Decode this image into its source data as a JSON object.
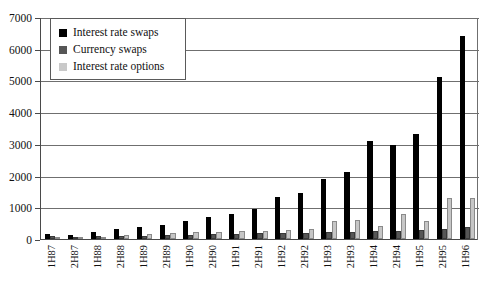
{
  "chart_data": {
    "type": "bar",
    "title": "",
    "subtitle": "",
    "xlabel": "",
    "ylabel": "",
    "ylim": [
      0,
      7000
    ],
    "ytick_step": 1000,
    "yticks": [
      0,
      1000,
      2000,
      3000,
      4000,
      5000,
      6000,
      7000
    ],
    "grid": true,
    "legend_position": "top-left",
    "categories": [
      "1H87",
      "2H87",
      "1H88",
      "2H88",
      "1H89",
      "2H89",
      "1H90",
      "2H90",
      "1H91",
      "2H91",
      "1H92",
      "2H92",
      "1H93",
      "2H93",
      "1H94",
      "2H94",
      "1H95",
      "2H95",
      "1H96"
    ],
    "series": [
      {
        "name": "Interest rate swaps",
        "color": "#000000",
        "values": [
          150,
          120,
          220,
          310,
          390,
          450,
          560,
          690,
          790,
          940,
          1320,
          1450,
          1890,
          2120,
          3100,
          2980,
          3300,
          5120,
          6400
        ]
      },
      {
        "name": "Currency swaps",
        "color": "#565656",
        "values": [
          80,
          60,
          80,
          95,
          110,
          120,
          130,
          150,
          160,
          175,
          190,
          200,
          210,
          230,
          250,
          260,
          270,
          330,
          390
        ]
      },
      {
        "name": "Interest rate options",
        "color": "#c6c6c6",
        "values": [
          30,
          60,
          75,
          120,
          150,
          190,
          215,
          230,
          250,
          260,
          290,
          330,
          560,
          590,
          420,
          790,
          570,
          1290,
          1300
        ]
      }
    ]
  },
  "legend": {
    "items": [
      {
        "label": "Interest rate swaps",
        "swatch": "black-square-icon"
      },
      {
        "label": "Currency swaps",
        "swatch": "dark-grey-square-icon"
      },
      {
        "label": "Interest rate options",
        "swatch": "light-grey-square-icon"
      }
    ]
  }
}
